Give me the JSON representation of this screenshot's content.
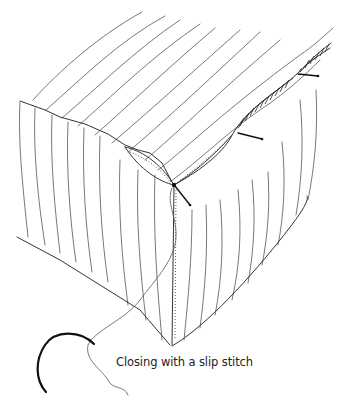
{
  "figure": {
    "caption": "Closing with a slip stitch",
    "colors": {
      "line": "#333333",
      "background": "#ffffff"
    }
  }
}
